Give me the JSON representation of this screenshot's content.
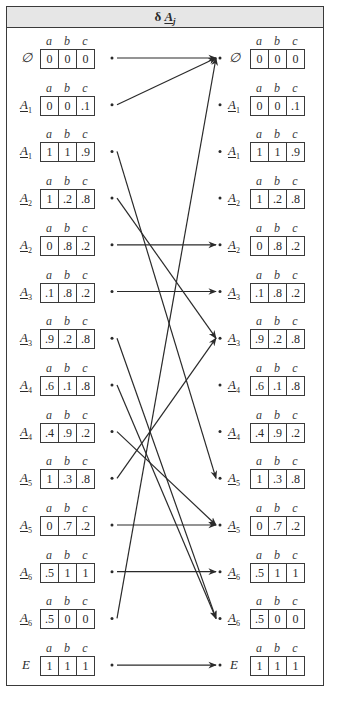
{
  "title": {
    "prefix": "δ",
    "symbol": "A",
    "subscript": "j"
  },
  "column_headers": [
    "a",
    "b",
    "c"
  ],
  "sets": [
    {
      "id": "empty",
      "label": "∅",
      "sub": "",
      "complement": false,
      "fuzzy": false,
      "values": [
        "0",
        "0",
        "0"
      ]
    },
    {
      "id": "A1",
      "label": "A",
      "sub": "1",
      "complement": false,
      "fuzzy": true,
      "values": [
        "0",
        "0",
        ".1"
      ]
    },
    {
      "id": "A1c",
      "label": "A",
      "sub": "1",
      "complement": true,
      "fuzzy": true,
      "values": [
        "1",
        "1",
        ".9"
      ]
    },
    {
      "id": "A2",
      "label": "A",
      "sub": "2",
      "complement": false,
      "fuzzy": true,
      "values": [
        "1",
        ".2",
        ".8"
      ]
    },
    {
      "id": "A2c",
      "label": "A",
      "sub": "2",
      "complement": true,
      "fuzzy": true,
      "values": [
        "0",
        ".8",
        ".2"
      ]
    },
    {
      "id": "A3",
      "label": "A",
      "sub": "3",
      "complement": false,
      "fuzzy": true,
      "values": [
        ".1",
        ".8",
        ".2"
      ]
    },
    {
      "id": "A3c",
      "label": "A",
      "sub": "3",
      "complement": true,
      "fuzzy": true,
      "values": [
        ".9",
        ".2",
        ".8"
      ]
    },
    {
      "id": "A4",
      "label": "A",
      "sub": "4",
      "complement": false,
      "fuzzy": true,
      "values": [
        ".6",
        ".1",
        ".8"
      ]
    },
    {
      "id": "A4c",
      "label": "A",
      "sub": "4",
      "complement": true,
      "fuzzy": true,
      "values": [
        ".4",
        ".9",
        ".2"
      ]
    },
    {
      "id": "A5",
      "label": "A",
      "sub": "5",
      "complement": false,
      "fuzzy": true,
      "values": [
        "1",
        ".3",
        ".8"
      ]
    },
    {
      "id": "A5c",
      "label": "A",
      "sub": "5",
      "complement": true,
      "fuzzy": true,
      "values": [
        "0",
        ".7",
        ".2"
      ]
    },
    {
      "id": "A6",
      "label": "A",
      "sub": "6",
      "complement": false,
      "fuzzy": true,
      "values": [
        ".5",
        "1",
        "1"
      ]
    },
    {
      "id": "A6c",
      "label": "A",
      "sub": "6",
      "complement": true,
      "fuzzy": true,
      "values": [
        ".5",
        "0",
        "0"
      ]
    },
    {
      "id": "E",
      "label": "E",
      "sub": "",
      "complement": false,
      "fuzzy": false,
      "values": [
        "1",
        "1",
        "1"
      ]
    }
  ],
  "mapping": [
    {
      "from": 0,
      "to": 0
    },
    {
      "from": 1,
      "to": 0
    },
    {
      "from": 2,
      "to": 9
    },
    {
      "from": 3,
      "to": 6
    },
    {
      "from": 4,
      "to": 4
    },
    {
      "from": 5,
      "to": 5
    },
    {
      "from": 6,
      "to": 12
    },
    {
      "from": 7,
      "to": 12
    },
    {
      "from": 8,
      "to": 10
    },
    {
      "from": 9,
      "to": 6
    },
    {
      "from": 10,
      "to": 10
    },
    {
      "from": 11,
      "to": 11
    },
    {
      "from": 12,
      "to": 0
    },
    {
      "from": 13,
      "to": 13
    }
  ]
}
